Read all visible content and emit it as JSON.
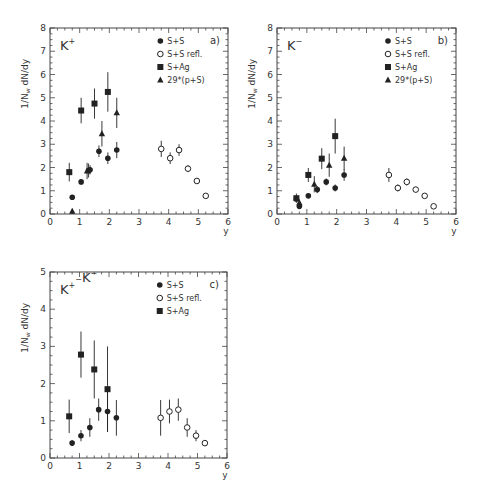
{
  "chart_data": [
    {
      "type": "scatter",
      "id": "a",
      "title": "K+",
      "panel_tag": "a)",
      "xlabel": "y",
      "ylabel": "1/N_w dN/dy",
      "xlim": [
        0,
        6
      ],
      "ylim": [
        0,
        8
      ],
      "xticks": [
        0,
        1,
        2,
        3,
        4,
        5,
        6
      ],
      "yticks": [
        0,
        1,
        2,
        3,
        4,
        5,
        6,
        7,
        8
      ],
      "legend_position": "upper right",
      "series": [
        {
          "name": "S+S",
          "marker": "filled-circle",
          "points": [
            [
              0.75,
              0.72,
              0.08
            ],
            [
              1.05,
              1.38,
              0.1
            ],
            [
              1.3,
              1.87,
              0.3
            ],
            [
              1.35,
              1.9,
              0.2
            ],
            [
              1.65,
              2.7,
              0.25
            ],
            [
              1.95,
              2.4,
              0.25
            ],
            [
              2.25,
              2.75,
              0.35
            ]
          ]
        },
        {
          "name": "S+S refl.",
          "marker": "open-circle",
          "points": [
            [
              3.75,
              2.8,
              0.35
            ],
            [
              4.05,
              2.4,
              0.25
            ],
            [
              4.35,
              2.75,
              0.25
            ],
            [
              4.65,
              1.95,
              0.15
            ],
            [
              4.95,
              1.42,
              0.1
            ],
            [
              5.25,
              0.78,
              0.08
            ]
          ]
        },
        {
          "name": "S+Ag",
          "marker": "filled-square",
          "points": [
            [
              0.65,
              1.8,
              0.4
            ],
            [
              1.05,
              4.45,
              0.55
            ],
            [
              1.5,
              4.75,
              0.65
            ],
            [
              1.95,
              5.25,
              0.85
            ]
          ]
        },
        {
          "name": "29*(p+S)",
          "marker": "filled-triangle",
          "points": [
            [
              0.75,
              0.12,
              0.1
            ],
            [
              1.25,
              1.85,
              0.35
            ],
            [
              1.75,
              3.45,
              0.55
            ],
            [
              2.25,
              4.35,
              0.65
            ]
          ]
        }
      ]
    },
    {
      "type": "scatter",
      "id": "b",
      "title": "K−",
      "panel_tag": "b)",
      "xlabel": "y",
      "ylabel": "1/N_w dN/dy",
      "xlim": [
        0,
        6
      ],
      "ylim": [
        0,
        8
      ],
      "xticks": [
        0,
        1,
        2,
        3,
        4,
        5,
        6
      ],
      "yticks": [
        0,
        1,
        2,
        3,
        4,
        5,
        6,
        7,
        8
      ],
      "legend_position": "upper right",
      "series": [
        {
          "name": "S+S",
          "marker": "filled-circle",
          "points": [
            [
              0.65,
              0.65,
              0.1
            ],
            [
              0.75,
              0.33,
              0.08
            ],
            [
              1.05,
              0.78,
              0.08
            ],
            [
              1.35,
              1.05,
              0.15
            ],
            [
              1.65,
              1.38,
              0.15
            ],
            [
              1.95,
              1.12,
              0.15
            ],
            [
              2.25,
              1.68,
              0.25
            ]
          ]
        },
        {
          "name": "S+S refl.",
          "marker": "open-circle",
          "points": [
            [
              3.75,
              1.68,
              0.3
            ],
            [
              4.05,
              1.12,
              0.15
            ],
            [
              4.35,
              1.38,
              0.15
            ],
            [
              4.65,
              1.05,
              0.12
            ],
            [
              4.95,
              0.78,
              0.08
            ],
            [
              5.25,
              0.33,
              0.06
            ]
          ]
        },
        {
          "name": "S+Ag",
          "marker": "filled-square",
          "points": [
            [
              0.65,
              0.68,
              0.2
            ],
            [
              1.05,
              1.68,
              0.3
            ],
            [
              1.5,
              2.38,
              0.45
            ],
            [
              1.95,
              3.35,
              0.75
            ]
          ]
        },
        {
          "name": "29*(p+S)",
          "marker": "filled-triangle",
          "points": [
            [
              0.75,
              0.48,
              0.15
            ],
            [
              1.25,
              1.28,
              0.35
            ],
            [
              1.75,
              2.1,
              0.5
            ],
            [
              2.25,
              2.4,
              0.5
            ]
          ]
        }
      ]
    },
    {
      "type": "scatter",
      "id": "c",
      "title": "K+−K−",
      "panel_tag": "c)",
      "xlabel": "y",
      "ylabel": "1/N_w dN/dy",
      "xlim": [
        0,
        6
      ],
      "ylim": [
        0,
        5
      ],
      "xticks": [
        0,
        1,
        2,
        3,
        4,
        5,
        6
      ],
      "yticks": [
        0,
        1,
        2,
        3,
        4,
        5
      ],
      "legend_position": "upper right",
      "series": [
        {
          "name": "S+S",
          "marker": "filled-circle",
          "points": [
            [
              0.75,
              0.4,
              0.08
            ],
            [
              1.05,
              0.6,
              0.15
            ],
            [
              1.35,
              0.82,
              0.25
            ],
            [
              1.65,
              1.3,
              0.3
            ],
            [
              1.95,
              1.25,
              0.55
            ],
            [
              2.25,
              1.08,
              0.48
            ]
          ]
        },
        {
          "name": "S+S refl.",
          "marker": "open-circle",
          "points": [
            [
              3.75,
              1.08,
              0.48
            ],
            [
              4.05,
              1.25,
              0.32
            ],
            [
              4.35,
              1.3,
              0.3
            ],
            [
              4.65,
              0.82,
              0.25
            ],
            [
              4.95,
              0.6,
              0.15
            ],
            [
              5.25,
              0.4,
              0.08
            ]
          ]
        },
        {
          "name": "S+Ag",
          "marker": "filled-square",
          "points": [
            [
              0.65,
              1.12,
              0.45
            ],
            [
              1.05,
              2.78,
              0.62
            ],
            [
              1.5,
              2.38,
              0.78
            ],
            [
              1.95,
              1.85,
              1.15
            ]
          ]
        }
      ]
    }
  ],
  "layout": [
    {
      "left": 50,
      "top": 28,
      "width": 178,
      "height": 186
    },
    {
      "left": 277,
      "top": 28,
      "width": 179,
      "height": 186
    },
    {
      "left": 50,
      "top": 272,
      "width": 177,
      "height": 186
    }
  ],
  "colors": {
    "ink": "#222222",
    "axis": "#444444",
    "background": "#ffffff"
  }
}
